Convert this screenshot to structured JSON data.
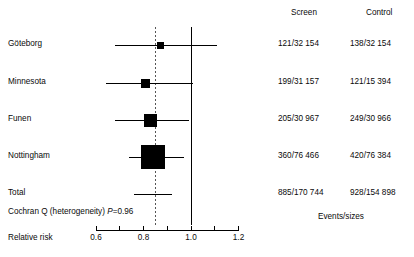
{
  "chart_data": {
    "type": "forest",
    "title": "",
    "xlabel": "Relative risk",
    "x_axis": {
      "ticks": [
        0.6,
        0.7,
        0.8,
        0.9,
        1.0,
        1.1,
        1.2
      ],
      "tick_labels": [
        "0.6",
        "",
        "0.8",
        "",
        "1.0",
        "",
        "1.2"
      ],
      "labeled_ticks": [
        "0.6",
        "0.8",
        "1.0",
        "1.2"
      ],
      "range": [
        0.55,
        1.25
      ],
      "null_line": 1.0,
      "pooled_line": 0.85,
      "grid": false
    },
    "columns": [
      "Screen",
      "Control"
    ],
    "column_footnote": "Events/sizes",
    "heterogeneity": "Cochran Q (heterogeneity) ",
    "heterogeneity_stat": "P",
    "heterogeneity_value": "=0.96",
    "rows": [
      {
        "study": "Göteborg",
        "rr": 0.87,
        "ci_low": 0.68,
        "ci_high": 1.11,
        "weight_box": 7,
        "screen": "121/32 154",
        "control": "138/32 154"
      },
      {
        "study": "Minnesota",
        "rr": 0.81,
        "ci_low": 0.64,
        "ci_high": 1.01,
        "weight_box": 9,
        "screen": "199/31 157",
        "control": "121/15 394"
      },
      {
        "study": "Funen",
        "rr": 0.83,
        "ci_low": 0.68,
        "ci_high": 0.99,
        "weight_box": 13,
        "screen": "205/30 967",
        "control": "249/30 966"
      },
      {
        "study": "Nottingham",
        "rr": 0.84,
        "ci_low": 0.74,
        "ci_high": 0.97,
        "weight_box": 24,
        "screen": "360/76 466",
        "control": "420/76 384"
      },
      {
        "study": "Total",
        "rr": 0.85,
        "ci_low": 0.76,
        "ci_high": 0.92,
        "weight_box": 0,
        "screen": "885/170 744",
        "control": "928/154 898"
      }
    ]
  },
  "colors": {
    "marker": "#000000",
    "line": "#000000",
    "axis": "#000000",
    "pooled_dashed": "#555555",
    "text": "#0a0a0a"
  }
}
